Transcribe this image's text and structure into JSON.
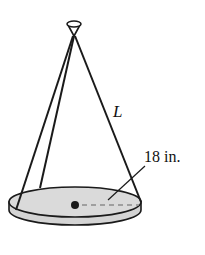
{
  "diagram": {
    "type": "conical-hanging-platter",
    "labels": {
      "slant_length": "L",
      "radius": "18 in."
    },
    "colors": {
      "stroke": "#1a1a1a",
      "disk_fill": "#d9d9d9",
      "dashed_radius": "#8c8c8c",
      "background": "#ffffff"
    }
  }
}
